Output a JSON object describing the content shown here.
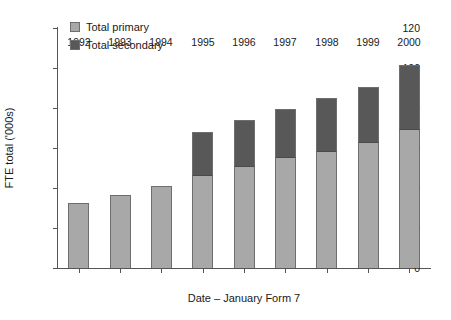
{
  "chart_data": {
    "type": "bar",
    "stacked": true,
    "title": "",
    "xlabel": "Date – January Form 7",
    "ylabel": "FTE total ('000s)",
    "categories": [
      "1992",
      "1993",
      "1994",
      "1995",
      "1996",
      "1997",
      "1998",
      "1999",
      "2000"
    ],
    "series": [
      {
        "name": "Total primary",
        "color": "#a8a8a8",
        "values": [
          32.5,
          36.5,
          41,
          46,
          50.5,
          55,
          58,
          62.5,
          69
        ]
      },
      {
        "name": "Total secondary",
        "color": "#585858",
        "values": [
          0,
          0,
          0,
          22,
          23.5,
          24.5,
          27,
          28,
          32.5
        ]
      }
    ],
    "totals": [
      32.5,
      36.5,
      41,
      68,
      74,
      79.5,
      85,
      90.5,
      101.5
    ],
    "ylim": [
      0,
      120
    ],
    "yticks": [
      0,
      20,
      40,
      60,
      80,
      100,
      120
    ],
    "ytick_labels": [
      "0",
      "20",
      "40",
      "60",
      "80",
      "100",
      "120"
    ],
    "grid": false,
    "legend_position": "top-left",
    "axis_color": "#555555",
    "bar_border_color": "#6e6e6e"
  },
  "legend": {
    "items": [
      {
        "label": "Total primary",
        "color": "#a8a8a8"
      },
      {
        "label": "Total secondary",
        "color": "#585858"
      }
    ]
  }
}
